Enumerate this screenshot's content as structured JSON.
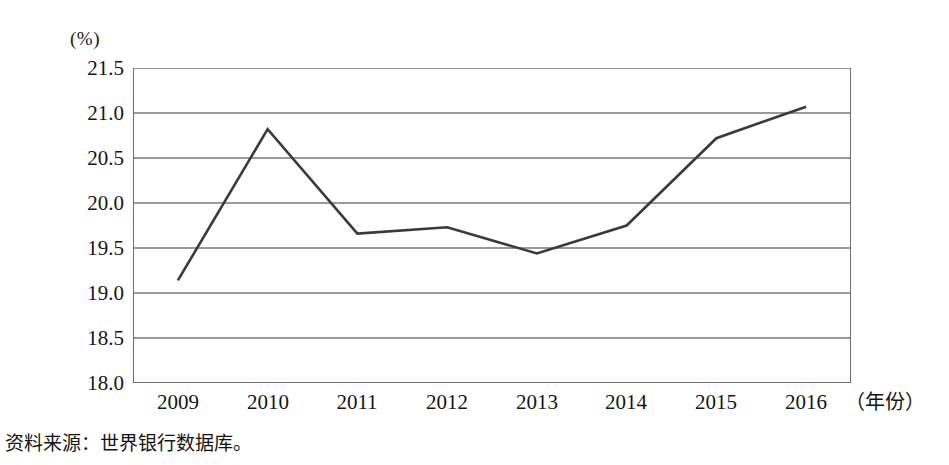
{
  "chart_data": {
    "type": "line",
    "title": "",
    "subtitle": "",
    "xlabel": "（年份）",
    "ylabel": "(%)",
    "categories": [
      "2009",
      "2010",
      "2011",
      "2012",
      "2013",
      "2014",
      "2015",
      "2016"
    ],
    "x": [
      2009,
      2010,
      2011,
      2012,
      2013,
      2014,
      2015,
      2016
    ],
    "values": [
      19.14,
      20.82,
      19.66,
      19.73,
      19.44,
      19.75,
      20.72,
      21.07
    ],
    "series": [
      {
        "name": "",
        "values": [
          19.14,
          20.82,
          19.66,
          19.73,
          19.44,
          19.75,
          20.72,
          21.07
        ]
      }
    ],
    "ylim": [
      18.0,
      21.5
    ],
    "yticks": [
      21.5,
      21.0,
      20.5,
      20.0,
      19.5,
      19.0,
      18.5,
      18.0
    ],
    "ytick_labels": [
      "21.5",
      "21.0",
      "20.5",
      "20.0",
      "19.5",
      "19.0",
      "18.5",
      "18.0"
    ],
    "grid": true,
    "grid_axis": "y",
    "legend": false,
    "legend_position": "none",
    "line_color": "#3a3a3a",
    "grid_color": "#9a9a9a",
    "axis_color": "#6e6e6e",
    "background_color": "#ffffff"
  },
  "axes": {
    "y_unit_label": "(%)",
    "x_unit_label": "（年份）"
  },
  "notes": {
    "source": "资料来源：世界银行数据库。"
  }
}
